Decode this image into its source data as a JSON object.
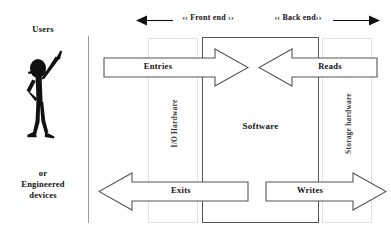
{
  "diagram": {
    "actors": {
      "users_label": "Users",
      "devices_label": "or\nEngineered\ndevices",
      "figure_icon": "stick-figure-person-icon"
    },
    "spans": {
      "front_end": "‹‹ Front end ››",
      "back_end": "‹‹ Back end››"
    },
    "columns": [
      {
        "id": "io-hardware",
        "label": "I/O Hardware",
        "orientation": "vertical"
      },
      {
        "id": "software",
        "label": "Software",
        "orientation": "horizontal"
      },
      {
        "id": "storage-hardware",
        "label": "Storage hardware",
        "orientation": "vertical"
      }
    ],
    "flows": [
      {
        "id": "entries",
        "label": "Entries",
        "direction": "right",
        "row": "top"
      },
      {
        "id": "reads",
        "label": "Reads",
        "direction": "left",
        "row": "top"
      },
      {
        "id": "exits",
        "label": "Exits",
        "direction": "left",
        "row": "bottom"
      },
      {
        "id": "writes",
        "label": "Writes",
        "direction": "right",
        "row": "bottom"
      }
    ],
    "colors": {
      "background": "#ffffff",
      "text": "#111111",
      "arrow_stroke": "#555555",
      "column_stroke": "#e2e2e2",
      "boundary_line": "#9b9b9b",
      "figure_fill": "#111111"
    }
  }
}
